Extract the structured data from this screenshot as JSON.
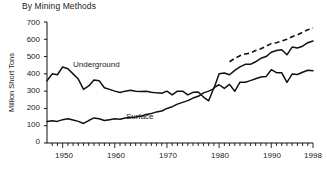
{
  "chart_data": {
    "type": "line",
    "title": "By Mining Methods",
    "xlabel": "",
    "ylabel": "Million Short Tons",
    "ylim": [
      0,
      700
    ],
    "xlim": [
      1947,
      1998
    ],
    "yticks": [
      0,
      100,
      200,
      300,
      400,
      500,
      600,
      700
    ],
    "ytick_labels": [
      "0",
      "100",
      "200",
      "300",
      "400",
      "500",
      "600",
      "700"
    ],
    "xticks": [
      1950,
      1960,
      1970,
      1980,
      1990,
      1998
    ],
    "xtick_labels": [
      "1950",
      "1960",
      "1970",
      "1980",
      "1990",
      "1998"
    ],
    "minor_xticks_every": 1,
    "grid": false,
    "legend_position": "inline-annotation",
    "annotations": [
      {
        "text": "Underground",
        "x": 1957,
        "y": 430
      },
      {
        "text": "Surface",
        "x": 1975,
        "y": 120
      }
    ],
    "x": [
      1947,
      1948,
      1949,
      1950,
      1951,
      1952,
      1953,
      1954,
      1955,
      1956,
      1957,
      1958,
      1959,
      1960,
      1961,
      1962,
      1963,
      1964,
      1965,
      1966,
      1967,
      1968,
      1969,
      1970,
      1971,
      1972,
      1973,
      1974,
      1975,
      1976,
      1977,
      1978,
      1979,
      1980,
      1981,
      1982,
      1983,
      1984,
      1985,
      1986,
      1987,
      1988,
      1989,
      1990,
      1991,
      1992,
      1993,
      1994,
      1995,
      1996,
      1997,
      1998
    ],
    "series": [
      {
        "name": "Underground",
        "style": "solid",
        "color": "#111111",
        "values": [
          360,
          400,
          395,
          440,
          430,
          400,
          370,
          310,
          330,
          365,
          360,
          320,
          310,
          300,
          292,
          300,
          305,
          300,
          298,
          300,
          294,
          290,
          288,
          300,
          278,
          300,
          300,
          278,
          293,
          295,
          266,
          244,
          320,
          337,
          316,
          339,
          299,
          352,
          351,
          361,
          372,
          382,
          384,
          424,
          407,
          407,
          351,
          399,
          396,
          409,
          421,
          418
        ]
      },
      {
        "name": "Surface",
        "style": "solid",
        "color": "#111111",
        "values": [
          125,
          128,
          125,
          135,
          140,
          133,
          125,
          113,
          130,
          145,
          140,
          130,
          135,
          140,
          138,
          145,
          148,
          150,
          155,
          165,
          170,
          180,
          185,
          200,
          210,
          225,
          235,
          245,
          260,
          270,
          290,
          300,
          315,
          400,
          405,
          395,
          420,
          440,
          455,
          455,
          470,
          490,
          500,
          525,
          535,
          540,
          510,
          555,
          550,
          560,
          580,
          590
        ]
      },
      {
        "name": "Total",
        "style": "dashed",
        "color": "#111111",
        "start_year": 1982,
        "values": [
          null,
          null,
          null,
          null,
          null,
          null,
          null,
          null,
          null,
          null,
          null,
          null,
          null,
          null,
          null,
          null,
          null,
          null,
          null,
          null,
          null,
          null,
          null,
          null,
          null,
          null,
          null,
          null,
          null,
          null,
          null,
          null,
          null,
          null,
          null,
          470,
          490,
          505,
          515,
          520,
          535,
          545,
          560,
          575,
          580,
          590,
          600,
          615,
          625,
          640,
          655,
          665
        ]
      }
    ]
  }
}
